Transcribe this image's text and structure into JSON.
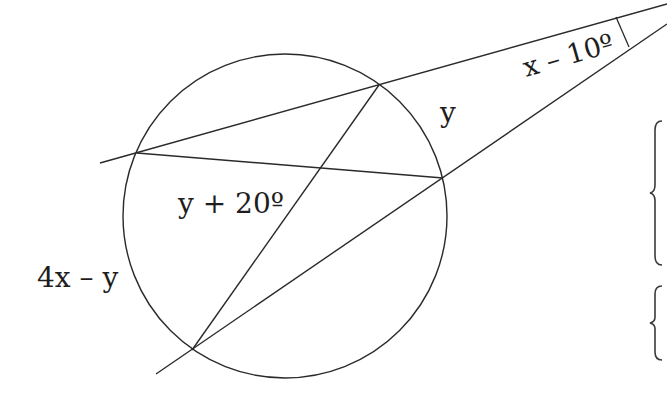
{
  "diagram": {
    "colors": {
      "stroke": "#2a2a2a",
      "text": "#1e1e1e",
      "background": "#ffffff"
    },
    "circle": {
      "cx": 285,
      "cy": 216,
      "r": 162
    },
    "points": {
      "A_left_upper": [
        137,
        153
      ],
      "B_top": [
        379,
        85
      ],
      "C_right": [
        443,
        178
      ],
      "D_bottom_left": [
        192,
        350
      ]
    },
    "segments": {
      "upper_secant": {
        "x1": 100,
        "y1": 163,
        "x2": 667,
        "y2": 4
      },
      "lower_secant": {
        "x1": 156,
        "y1": 374,
        "x2": 667,
        "y2": 24
      },
      "chord_AC": {
        "x1": 137,
        "y1": 153,
        "x2": 443,
        "y2": 178
      },
      "chord_BD": {
        "x1": 379,
        "y1": 85,
        "x2": 192,
        "y2": 350
      },
      "angle_mark": {
        "x1": 616,
        "y1": 17,
        "x2": 629,
        "y2": 47
      }
    },
    "labels": {
      "external_angle": "x – 10º",
      "arc_small": "y",
      "interior_angle": "y + 20º",
      "arc_large": "4x – y"
    },
    "braces": [
      {
        "x": 655,
        "y_top": 120,
        "y_bottom": 265
      },
      {
        "x": 655,
        "y_top": 285,
        "y_bottom": 360
      }
    ]
  }
}
